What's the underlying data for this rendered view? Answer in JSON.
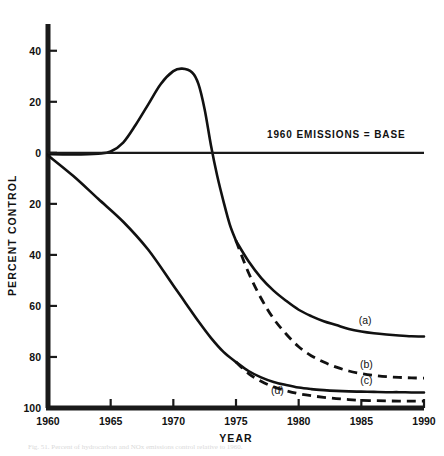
{
  "figure": {
    "caption": "Fig. 51.  Percent of hydrocarbon and NOx emissions control relative to 1960.",
    "background_color": "#ffffff",
    "ink_color": "#111111"
  },
  "chart_data": {
    "type": "line",
    "title": "",
    "xlabel": "YEAR",
    "ylabel": "PERCENT CONTROL",
    "xlim": [
      1960,
      1990
    ],
    "ylim": [
      -100,
      45
    ],
    "grid": false,
    "legend": "inline-curve-labels",
    "x_ticks": [
      1960,
      1965,
      1970,
      1975,
      1980,
      1985,
      1990
    ],
    "x_tick_labels": [
      "1960",
      "1965",
      "1970",
      "1975",
      "1980",
      "1985",
      "1990"
    ],
    "y_ticks": [
      40,
      20,
      0,
      -20,
      -40,
      -60,
      -80,
      -100
    ],
    "y_tick_labels": [
      "40",
      "20",
      "0",
      "20",
      "40",
      "60",
      "80",
      "100"
    ],
    "annotations": [
      {
        "name": "baseline-note",
        "text": "1960 EMISSIONS = BASE",
        "x": 1983.0,
        "y": 6.0
      }
    ],
    "series": [
      {
        "name": "uncontrolled-emissions-growth",
        "label": "",
        "style": "solid",
        "x": [
          1960,
          1962,
          1964,
          1965,
          1966,
          1967,
          1968,
          1969,
          1970,
          1970.7,
          1971.5,
          1972,
          1972.5,
          1973,
          1973.5,
          1974,
          1974.5,
          1975
        ],
        "y": [
          -0.5,
          -0.6,
          -0.3,
          0.5,
          4.0,
          11.0,
          19.0,
          27.0,
          32.0,
          33.0,
          31.5,
          27.0,
          17.0,
          3.0,
          -9.0,
          -19.0,
          -28.0,
          -34.5
        ]
      },
      {
        "name": "curve-a",
        "label": "(a)",
        "style": "solid",
        "label_x": 1985.3,
        "label_y": -67.0,
        "x": [
          1975,
          1976,
          1977,
          1978,
          1979,
          1980,
          1981,
          1982,
          1983,
          1984,
          1985,
          1986,
          1987,
          1988,
          1989,
          1990
        ],
        "y": [
          -34.5,
          -42.5,
          -49.0,
          -54.0,
          -58.0,
          -61.5,
          -64.0,
          -66.0,
          -67.5,
          -69.0,
          -70.0,
          -70.7,
          -71.2,
          -71.6,
          -71.9,
          -72.0
        ]
      },
      {
        "name": "curve-b",
        "label": "(b)",
        "style": "dashed",
        "label_x": 1985.4,
        "label_y": -84.5,
        "x": [
          1975,
          1976,
          1977,
          1978,
          1979,
          1980,
          1981,
          1982,
          1983,
          1984,
          1985,
          1986,
          1987,
          1988,
          1989,
          1990
        ],
        "y": [
          -34.5,
          -47.0,
          -57.0,
          -65.0,
          -71.0,
          -76.0,
          -79.5,
          -82.0,
          -84.0,
          -85.5,
          -86.5,
          -87.2,
          -87.7,
          -88.0,
          -88.2,
          -88.3
        ]
      },
      {
        "name": "baseline-decline",
        "label": "",
        "style": "solid",
        "x": [
          1960,
          1962,
          1964,
          1966,
          1968,
          1970,
          1971,
          1972,
          1973,
          1974,
          1975
        ],
        "y": [
          -1.0,
          -9.0,
          -18.0,
          -27.0,
          -38.0,
          -52.0,
          -59.0,
          -66.0,
          -72.5,
          -78.0,
          -82.0
        ]
      },
      {
        "name": "curve-c",
        "label": "(c)",
        "style": "solid",
        "label_x": 1985.4,
        "label_y": -90.5,
        "x": [
          1975,
          1976,
          1977,
          1978,
          1979,
          1980,
          1981,
          1982,
          1983,
          1984,
          1985,
          1986,
          1987,
          1988,
          1989,
          1990
        ],
        "y": [
          -82.0,
          -85.5,
          -88.0,
          -89.8,
          -91.0,
          -92.0,
          -92.6,
          -93.0,
          -93.3,
          -93.5,
          -93.6,
          -93.7,
          -93.8,
          -93.8,
          -93.9,
          -93.9
        ]
      },
      {
        "name": "curve-d",
        "label": "(d)",
        "style": "dashed",
        "label_x": 1978.3,
        "label_y": -94.5,
        "x": [
          1975,
          1976,
          1977,
          1978,
          1979,
          1980,
          1981,
          1982,
          1983,
          1984,
          1985,
          1986,
          1987,
          1988,
          1989,
          1990
        ],
        "y": [
          -82.0,
          -86.5,
          -89.5,
          -91.7,
          -93.2,
          -94.4,
          -95.2,
          -95.8,
          -96.3,
          -96.7,
          -97.0,
          -97.1,
          -97.2,
          -97.3,
          -97.3,
          -97.3
        ]
      }
    ]
  }
}
